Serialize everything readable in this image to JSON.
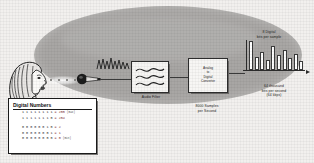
{
  "diagram": {
    "stages": {
      "source_icon": "speaking-person-icon",
      "mic_icon": "microphone-icon",
      "soundwave_icon": "sound-wave-icon",
      "filter": {
        "icon": "waveform-icon",
        "label": "Audio Filter"
      },
      "converter": {
        "label_line1": "Analog",
        "label_line2": "to",
        "label_line3": "Digital",
        "label_line4": "Converter",
        "rate_line1": "8000 Samples",
        "rate_line2": "per Second"
      },
      "output": {
        "top_label_line1": "8 Digital",
        "top_label_line2": "bits per sample",
        "bottom_label_line1": "64 thousand",
        "bottom_label_line2": "bits per second",
        "bottom_label_line3": "(64 kbps)"
      }
    }
  },
  "digital_numbers": {
    "title": "Digital Numbers",
    "rows_top": [
      {
        "bits": "11111111",
        "eq": "= 255",
        "note": "(max)"
      },
      {
        "bits": "11111110",
        "eq": "= 254",
        "note": ""
      }
    ],
    "rows_bottom": [
      {
        "bits": "00000010",
        "eq": "= 2",
        "note": ""
      },
      {
        "bits": "00000001",
        "eq": "= 1",
        "note": ""
      },
      {
        "bits": "00000000",
        "eq": "= 0",
        "note": "(min)"
      }
    ]
  },
  "chart_data": {
    "type": "bar",
    "title": "8 Digital bits per sample",
    "xlabel": "64 thousand bits per second (64 kbps)",
    "ylabel": "",
    "categories": [
      "1",
      "2",
      "3",
      "4",
      "5",
      "6",
      "7",
      "8",
      "9",
      "10"
    ],
    "values": [
      30,
      12,
      18,
      9,
      24,
      14,
      20,
      11,
      16,
      8
    ],
    "ylim": [
      0,
      32
    ],
    "grid": false,
    "legend": "none"
  },
  "colors": {
    "ellipse": "#a8a6a4",
    "page": "#f2f0ee",
    "ink": "#1d1d1d",
    "box_fill": "#f7f6f4",
    "shadow": "#6e6c6a",
    "accent_red": "#7a2a2a"
  }
}
